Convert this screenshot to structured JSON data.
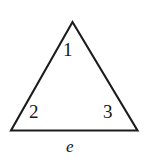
{
  "figure": {
    "name": "triangle-with-numbered-angles",
    "background_color": "#ffffff",
    "stroke_color": "#1c1c1c",
    "stroke_width": 2.1,
    "width": 149,
    "height": 162,
    "shape": {
      "type": "triangle",
      "vertices": [
        {
          "name": "apex",
          "x": 72.5,
          "y": 22
        },
        {
          "name": "bottom-left",
          "x": 11,
          "y": 130.5
        },
        {
          "name": "bottom-right",
          "x": 137.5,
          "y": 130.5
        }
      ],
      "polygon_points": "72.5,22 137.5,130.5 11,130.5"
    },
    "angle_labels": [
      {
        "id": "1",
        "text": "1",
        "x": 63,
        "y": 40,
        "描述": "interior angle at apex"
      },
      {
        "id": "2",
        "text": "2",
        "x": 29,
        "y": 102
      },
      {
        "id": "3",
        "text": "3",
        "x": 103,
        "y": 102
      }
    ],
    "side_label": {
      "id": "e",
      "text": "e",
      "style": "italic",
      "x": 66,
      "y": 138
    }
  }
}
